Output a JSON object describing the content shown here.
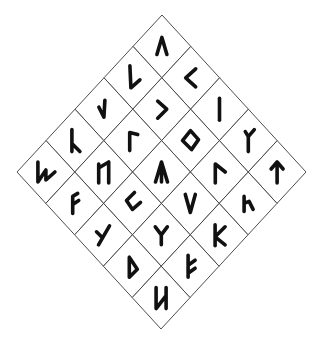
{
  "diagram": {
    "type": "rune-grid",
    "shape": "diamond (5x5 grid rotated 45 degrees)",
    "grid_size": 5,
    "line_color": "#3a3a3a",
    "rune_color": "#111111",
    "background": "#ffffff",
    "geometry": {
      "top": [
        162,
        15
      ],
      "right": [
        306,
        172
      ],
      "bottom": [
        162,
        330
      ],
      "left": [
        17,
        172
      ]
    },
    "cells": [
      {
        "i": 0,
        "j": 0,
        "name": "rune-caret",
        "glyph": "Λ",
        "path": "M-5 8 L0 -9 L5 8"
      },
      {
        "i": 1,
        "j": 0,
        "name": "rune-kaunan",
        "glyph": "<",
        "path": "M5 -9 L-5 0 L5 9"
      },
      {
        "i": 2,
        "j": 0,
        "name": "rune-isaz",
        "glyph": "ᛁ",
        "path": "M0 -11 L0 11"
      },
      {
        "i": 3,
        "j": 0,
        "name": "rune-fork-stem",
        "glyph": "ᛉ",
        "path": "M0 11 L0 -4 M0 -4 L6 -11 M0 -4 L-3 -9"
      },
      {
        "i": 4,
        "j": 0,
        "name": "rune-tiwaz",
        "glyph": "ᛏ",
        "path": "M0 11 L0 -10 M-6 -3 L0 -10 L6 -3"
      },
      {
        "i": 0,
        "j": 1,
        "name": "rune-long-check",
        "glyph": "ᛚ",
        "path": "M-3 -12 L-2 10 L7 2"
      },
      {
        "i": 1,
        "j": 1,
        "name": "rune-right-hook",
        "glyph": "ᛃ",
        "path": "M-4 -8 L5 0 L-4 9"
      },
      {
        "i": 2,
        "j": 1,
        "name": "rune-ingwaz",
        "glyph": "ᛜ",
        "path": "M0 -10 L8 -1 L1 9 L-8 0 Z"
      },
      {
        "i": 3,
        "j": 1,
        "name": "rune-gamma-slant",
        "glyph": "ᚴ",
        "path": "M-4 11 L-4 -8 L6 0"
      },
      {
        "i": 4,
        "j": 1,
        "name": "rune-small-h",
        "glyph": "ᚢ",
        "path": "M-4 -7 L-4 8 M-4 0 L1 -2 L5 6"
      },
      {
        "i": 0,
        "j": 2,
        "name": "rune-short-check",
        "glyph": "ᛚ",
        "path": "M-5 -2 L0 8 L1 -9"
      },
      {
        "i": 1,
        "j": 2,
        "name": "rune-gamma",
        "glyph": "ᚴ",
        "path": "M-3 10 L-3 -8 L5 -6"
      },
      {
        "i": 2,
        "j": 2,
        "name": "rune-arrow-stem",
        "glyph": "ᛦ",
        "path": "M-6 10 L0 -10 L6 10 M0 -10 L0 10"
      },
      {
        "i": 3,
        "j": 2,
        "name": "rune-vee",
        "glyph": "V",
        "path": "M-5 -9 L0 9 L5 -9"
      },
      {
        "i": 4,
        "j": 2,
        "name": "rune-kay",
        "glyph": "K",
        "path": "M-4 -10 L-4 11 M6 -8 L-4 2 L6 10"
      },
      {
        "i": 0,
        "j": 3,
        "name": "rune-lambda",
        "glyph": "ᛅ",
        "path": "M-3 -11 L-3 11 M-3 3 L5 11"
      },
      {
        "i": 1,
        "j": 3,
        "name": "rune-hagalaz",
        "glyph": "ᚺ",
        "path": "M-5 -8 L-5 11 M-5 -4 L5 -10 L5 11"
      },
      {
        "i": 2,
        "j": 3,
        "name": "rune-square-c",
        "glyph": "ᚲ",
        "path": "M2 -11 L-6 -3 L0 6 L8 -1"
      },
      {
        "i": 3,
        "j": 3,
        "name": "rune-ypsilon",
        "glyph": "Y",
        "path": "M-6 -8 L0 0 L6 -8 M0 0 L0 10"
      },
      {
        "i": 4,
        "j": 3,
        "name": "rune-fehu-variant",
        "glyph": "ᚠ",
        "path": "M-2 -11 L-2 11 M-2 -1 L5 -6 M-2 7 L5 2"
      },
      {
        "i": 0,
        "j": 4,
        "name": "rune-wunjo-slant",
        "glyph": "ᚹ",
        "path": "M-8 -10 L-8 10 L0 -2 L0 8 L9 0"
      },
      {
        "i": 1,
        "j": 4,
        "name": "rune-ansuz",
        "glyph": "ᚨ",
        "path": "M-2 10 L-2 -7 L3 -10 M-2 1 L4 -3"
      },
      {
        "i": 2,
        "j": 4,
        "name": "rune-slant-y",
        "glyph": "ᛉ",
        "path": "M-7 -3 L-1 3 M6 -9 L-5 10"
      },
      {
        "i": 3,
        "j": 4,
        "name": "rune-thurisaz",
        "glyph": "ᚦ",
        "path": "M-3 -9 L-3 11 L5 3 Z"
      },
      {
        "i": 4,
        "j": 4,
        "name": "rune-naudiz",
        "glyph": "ᚾ",
        "path": "M-5 -10 L-5 11 L5 -2 M5 -10 L5 11"
      }
    ]
  },
  "caption": {
    "text": ""
  }
}
